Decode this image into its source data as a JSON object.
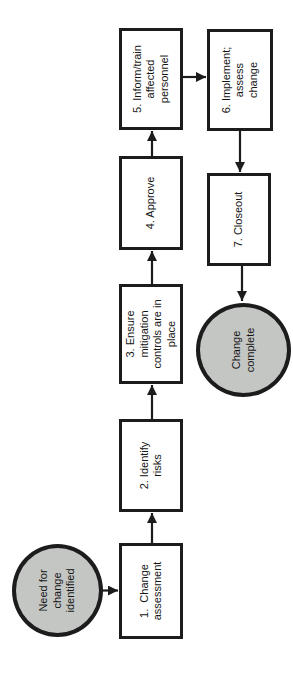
{
  "flowchart": {
    "orientation": "rotated-90-counterclockwise",
    "colors": {
      "background": "#ffffff",
      "stroke": "#1c1c1c",
      "process_fill": "#ffffff",
      "terminator_fill": "#c4c6c4"
    },
    "nodes": {
      "start": {
        "type": "terminator",
        "label": "Need for\nchange\nidentified"
      },
      "step1": {
        "type": "process",
        "label": "1.  Change\nassessment"
      },
      "step2": {
        "type": "process",
        "label": "2. Identify\nrisks"
      },
      "step3": {
        "type": "process",
        "label": "3. Ensure\nmitigation\ncontrols are in\nplace"
      },
      "step4": {
        "type": "process",
        "label": "4. Approve"
      },
      "step5": {
        "type": "process",
        "label": "5. Inform/train\naffected\npersonnel"
      },
      "step6": {
        "type": "process",
        "label": "6. Implement;\nassess\nchange"
      },
      "step7": {
        "type": "process",
        "label": "7. Closeout"
      },
      "end": {
        "type": "terminator",
        "label": "Change\ncomplete"
      }
    },
    "edges": [
      {
        "from": "start",
        "to": "step1"
      },
      {
        "from": "step1",
        "to": "step2"
      },
      {
        "from": "step2",
        "to": "step3"
      },
      {
        "from": "step3",
        "to": "step4"
      },
      {
        "from": "step4",
        "to": "step5"
      },
      {
        "from": "step5",
        "to": "step6"
      },
      {
        "from": "step6",
        "to": "step7"
      },
      {
        "from": "step7",
        "to": "end"
      }
    ]
  }
}
